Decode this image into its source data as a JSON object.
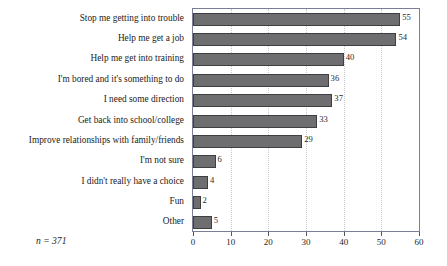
{
  "chart_data": {
    "type": "bar",
    "orientation": "horizontal",
    "title": "",
    "subtitle": "",
    "xlabel": "",
    "ylabel": "",
    "xlim": [
      0,
      60
    ],
    "xticks": [
      0,
      10,
      20,
      30,
      40,
      50,
      60
    ],
    "xtick_labels": [
      "0",
      "10",
      "20",
      "30",
      "40",
      "50",
      "60"
    ],
    "grid": "vertical-dotted",
    "legend": "none",
    "bar_color": "#6e6e70",
    "bar_edge_color": "#3f3f41",
    "frame_color": "#7b7f96",
    "categories": [
      "Stop me getting into trouble",
      "Help me get a job",
      "Help me get into training",
      "I'm bored and it's something to do",
      "I need some direction",
      "Get back into school/college",
      "Improve relationships with family/friends",
      "I'm not sure",
      "I didn't really have a choice",
      "Fun",
      "Other"
    ],
    "values": [
      55,
      54,
      40,
      36,
      37,
      33,
      29,
      6,
      4,
      2,
      5
    ],
    "value_labels": [
      "55",
      "54",
      "40",
      "36",
      "37",
      "33",
      "29",
      "6",
      "4",
      "2",
      "5"
    ],
    "annotations": [
      {
        "name": "sample-size",
        "text": "n = 371"
      }
    ]
  }
}
